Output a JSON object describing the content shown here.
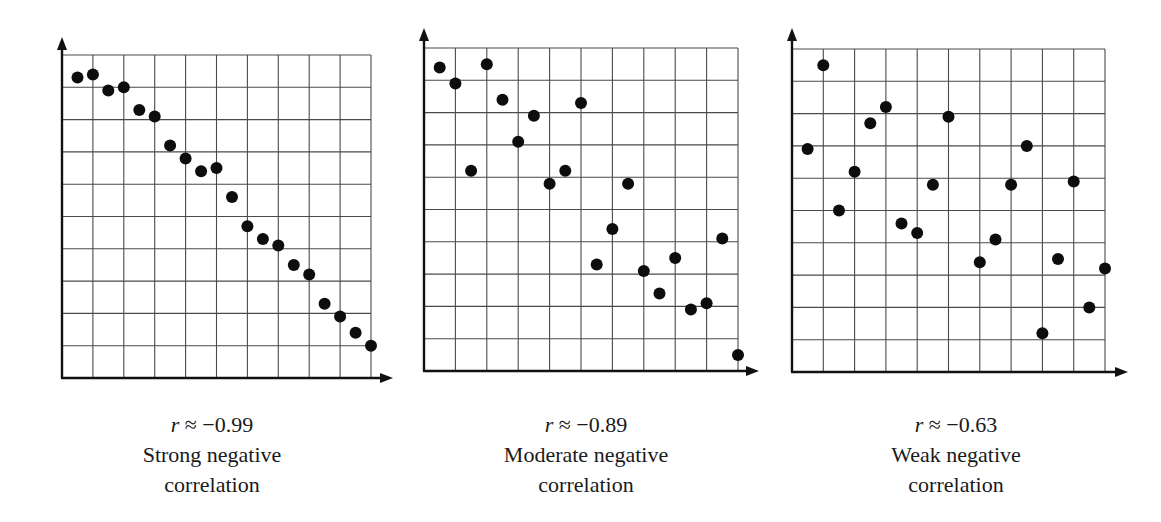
{
  "chart_data": [
    {
      "type": "scatter",
      "title": "Strong negative correlation",
      "r_label": "r ≈ −0.99",
      "r_value": -0.99,
      "description": "Strong negative",
      "description_line2": "correlation",
      "xlabel": "",
      "ylabel": "",
      "grid": true,
      "grid_cols": 10,
      "grid_rows": 10,
      "xlim": [
        0,
        10
      ],
      "ylim": [
        0,
        10
      ],
      "geometry": {
        "gx0": 62,
        "gx1": 371,
        "gy0": 55,
        "gy1": 378,
        "arrow_top": 37,
        "arrow_right": 393
      },
      "points": [
        [
          0.5,
          9.3
        ],
        [
          1.0,
          9.4
        ],
        [
          1.5,
          8.9
        ],
        [
          2.0,
          9.0
        ],
        [
          2.5,
          8.3
        ],
        [
          3.0,
          8.1
        ],
        [
          3.5,
          7.2
        ],
        [
          4.0,
          6.8
        ],
        [
          4.5,
          6.4
        ],
        [
          5.0,
          6.5
        ],
        [
          5.5,
          5.6
        ],
        [
          6.0,
          4.7
        ],
        [
          6.5,
          4.3
        ],
        [
          7.0,
          4.1
        ],
        [
          7.5,
          3.5
        ],
        [
          8.0,
          3.2
        ],
        [
          8.5,
          2.3
        ],
        [
          9.0,
          1.9
        ],
        [
          9.5,
          1.4
        ],
        [
          10.0,
          1.0
        ]
      ]
    },
    {
      "type": "scatter",
      "title": "Moderate negative correlation",
      "r_label": "r ≈ −0.89",
      "r_value": -0.89,
      "description": "Moderate negative",
      "description_line2": "correlation",
      "xlabel": "",
      "ylabel": "",
      "grid": true,
      "grid_cols": 10,
      "grid_rows": 10,
      "xlim": [
        0,
        10
      ],
      "ylim": [
        0,
        10
      ],
      "geometry": {
        "gx0": 424,
        "gx1": 738,
        "gy0": 48,
        "gy1": 371,
        "arrow_top": 28,
        "arrow_right": 759
      },
      "points": [
        [
          0.5,
          9.4
        ],
        [
          1.0,
          8.9
        ],
        [
          1.5,
          6.2
        ],
        [
          2.0,
          9.5
        ],
        [
          2.5,
          8.4
        ],
        [
          3.0,
          7.1
        ],
        [
          3.5,
          7.9
        ],
        [
          4.0,
          5.8
        ],
        [
          4.5,
          6.2
        ],
        [
          5.0,
          8.3
        ],
        [
          5.5,
          3.3
        ],
        [
          6.0,
          4.4
        ],
        [
          6.5,
          5.8
        ],
        [
          7.0,
          3.1
        ],
        [
          7.5,
          2.4
        ],
        [
          8.0,
          3.5
        ],
        [
          8.5,
          1.9
        ],
        [
          9.0,
          2.1
        ],
        [
          9.5,
          4.1
        ],
        [
          10.0,
          0.5
        ]
      ]
    },
    {
      "type": "scatter",
      "title": "Weak negative correlation",
      "r_label": "r ≈ −0.63",
      "r_value": -0.63,
      "description": "Weak negative",
      "description_line2": "correlation",
      "xlabel": "",
      "ylabel": "",
      "grid": true,
      "grid_cols": 10,
      "grid_rows": 10,
      "xlim": [
        0,
        10
      ],
      "ylim": [
        0,
        10
      ],
      "geometry": {
        "gx0": 792,
        "gx1": 1105,
        "gy0": 49,
        "gy1": 372,
        "arrow_top": 28,
        "arrow_right": 1128
      },
      "points": [
        [
          0.5,
          6.9
        ],
        [
          1.0,
          9.5
        ],
        [
          1.5,
          5.0
        ],
        [
          2.0,
          6.2
        ],
        [
          2.5,
          7.7
        ],
        [
          3.0,
          8.2
        ],
        [
          3.5,
          4.6
        ],
        [
          4.0,
          4.3
        ],
        [
          4.5,
          5.8
        ],
        [
          5.0,
          7.9
        ],
        [
          6.0,
          3.4
        ],
        [
          6.5,
          4.1
        ],
        [
          7.0,
          5.8
        ],
        [
          7.5,
          7.0
        ],
        [
          8.0,
          1.2
        ],
        [
          8.5,
          3.5
        ],
        [
          9.0,
          5.9
        ],
        [
          9.5,
          2.0
        ],
        [
          10.0,
          3.2
        ]
      ]
    }
  ],
  "captions": [
    {
      "r_var": "r",
      "r_rest": " ≈ −0.99",
      "line1": "Strong negative",
      "line2": "correlation"
    },
    {
      "r_var": "r",
      "r_rest": " ≈ −0.89",
      "line1": "Moderate negative",
      "line2": "correlation"
    },
    {
      "r_var": "r",
      "r_rest": " ≈ −0.63",
      "line1": "Weak negative",
      "line2": "correlation"
    }
  ],
  "style": {
    "dot_color": "#0d0d0d",
    "grid_color": "#4a4a4a",
    "axis_color": "#111111",
    "dot_radius": 6
  }
}
